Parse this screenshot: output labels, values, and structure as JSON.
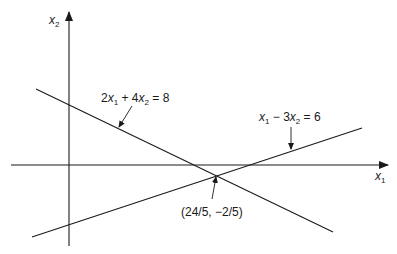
{
  "diagram": {
    "title": "",
    "axes": {
      "x_label": "x",
      "x_label_sub": "1",
      "y_label": "x",
      "y_label_sub": "2"
    },
    "lines": [
      {
        "id": "line-constraint-1",
        "equation": "2x1 + 4x2 = 8",
        "label_parts": [
          "2",
          "x",
          "1",
          " + 4",
          "x",
          "2",
          " = 8"
        ]
      },
      {
        "id": "line-constraint-2",
        "equation": "x1 − 3x2 = 6",
        "label_parts": [
          "",
          "x",
          "1",
          " − 3",
          "x",
          "2",
          " = 6"
        ]
      }
    ],
    "intersection": {
      "label": "(24/5, −2/5)",
      "x": "24/5",
      "y": "−2/5"
    },
    "colors": {
      "line": "#1a1a1a",
      "background": "#ffffff"
    }
  }
}
